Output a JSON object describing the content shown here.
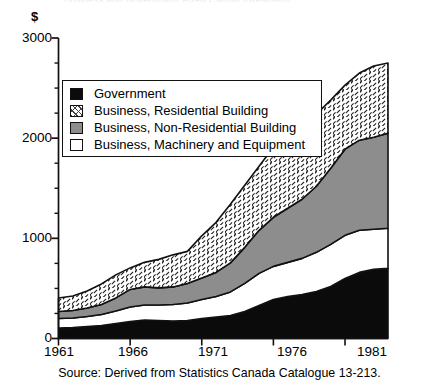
{
  "figure": {
    "title_remnant": "Business and Government Fixed Capital Investment",
    "y_axis_unit_label": "$",
    "source_note": "Source: Derived from Statistics Canada Catalogue 13-213."
  },
  "legend": {
    "items": [
      {
        "label": "Government",
        "swatch": "solid-black-swatch"
      },
      {
        "label": "Business,  Residential Building",
        "swatch": "hatched-swatch"
      },
      {
        "label": "Business,  Non-Residential Building",
        "swatch": "gray-swatch"
      },
      {
        "label": "Business,  Machinery and Equipment",
        "swatch": "white-swatch"
      }
    ]
  },
  "axes": {
    "y_ticks": [
      "0",
      "1000",
      "2000",
      "3000"
    ],
    "x_ticks": [
      "1961",
      "1966",
      "1971",
      "1976",
      "1981"
    ]
  },
  "colors": {
    "government": "#0b0b0b",
    "residential": "#ffffff",
    "non_residential": "#8d8d8d",
    "machinery": "#ffffff",
    "outline": "#111111",
    "background": "#ffffff"
  },
  "chart_data": {
    "type": "area",
    "stacked": true,
    "title": "Business and Government Fixed Capital Investment",
    "xlabel": "",
    "ylabel": "$",
    "xlim": [
      1961,
      1984
    ],
    "ylim": [
      0,
      3000
    ],
    "y_ticks": [
      0,
      1000,
      2000,
      3000
    ],
    "y_minor_tick_interval": 250,
    "x_ticks": [
      1961,
      1966,
      1971,
      1976,
      1981
    ],
    "grid": false,
    "legend_position": "upper-left-inside",
    "x": [
      1961,
      1962,
      1963,
      1964,
      1965,
      1966,
      1967,
      1968,
      1969,
      1970,
      1971,
      1972,
      1973,
      1974,
      1975,
      1976,
      1977,
      1978,
      1979,
      1980,
      1981,
      1982,
      1983,
      1984
    ],
    "series": [
      {
        "name": "Government",
        "stack_order": 1,
        "values": [
          105,
          110,
          120,
          130,
          150,
          170,
          185,
          180,
          175,
          180,
          200,
          215,
          230,
          270,
          330,
          390,
          420,
          440,
          470,
          520,
          600,
          660,
          690,
          700
        ]
      },
      {
        "name": "Business,  Machinery and Equipment",
        "stack_order": 2,
        "values": [
          95,
          95,
          100,
          110,
          125,
          145,
          150,
          155,
          165,
          175,
          190,
          205,
          235,
          280,
          320,
          330,
          340,
          360,
          390,
          420,
          430,
          420,
          400,
          400
        ]
      },
      {
        "name": "Business,  Non-Residential Building",
        "stack_order": 3,
        "values": [
          70,
          75,
          85,
          100,
          130,
          175,
          180,
          170,
          175,
          195,
          215,
          240,
          290,
          360,
          430,
          490,
          540,
          590,
          660,
          760,
          860,
          900,
          920,
          950
        ]
      },
      {
        "name": "Business,  Residential Building",
        "stack_order": 4,
        "values": [
          135,
          145,
          170,
          205,
          230,
          215,
          245,
          285,
          320,
          320,
          420,
          500,
          585,
          620,
          640,
          700,
          690,
          690,
          720,
          680,
          640,
          670,
          710,
          700
        ]
      }
    ],
    "cumulative_totals": [
      405,
      425,
      475,
      545,
      635,
      705,
      760,
      790,
      835,
      870,
      1025,
      1160,
      1340,
      1530,
      1720,
      1910,
      1990,
      2080,
      2240,
      2380,
      2530,
      2650,
      2720,
      2750
    ]
  }
}
